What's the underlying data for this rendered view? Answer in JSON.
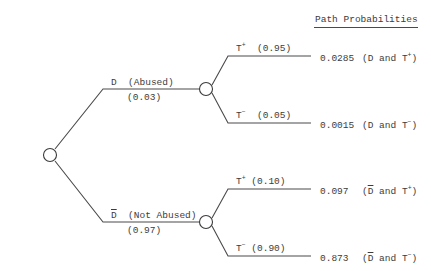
{
  "header": {
    "title": "Path Probabilities"
  },
  "root": {
    "branches": [
      {
        "symbol": "D",
        "label": "(Abused)",
        "probability": "(0.03)",
        "children": [
          {
            "symbol": "T",
            "sign": "+",
            "probability": "(0.95)",
            "path_probability": "0.0285",
            "path_label_prefix": "(D and T",
            "path_sign": "+",
            "path_label_suffix": ")"
          },
          {
            "symbol": "T",
            "sign": "−",
            "probability": "(0.05)",
            "path_probability": "0.0015",
            "path_label_prefix": "(D and T",
            "path_sign": "−",
            "path_label_suffix": ")"
          }
        ]
      },
      {
        "symbol": "D",
        "label": "(Not Abused)",
        "probability": "(0.97)",
        "children": [
          {
            "symbol": "T",
            "sign": "+",
            "probability": "(0.10)",
            "path_probability": "0.097",
            "path_label_prefix": " and T",
            "path_sign": "+",
            "path_label_suffix": ")"
          },
          {
            "symbol": "T",
            "sign": "−",
            "probability": "(0.90)",
            "path_probability": "0.873",
            "path_label_prefix": " and T",
            "path_sign": "−",
            "path_label_suffix": ")"
          }
        ]
      }
    ]
  },
  "colors": {
    "line": "#4a4a4a",
    "text": "#3c3c3c",
    "background": "#ffffff"
  }
}
